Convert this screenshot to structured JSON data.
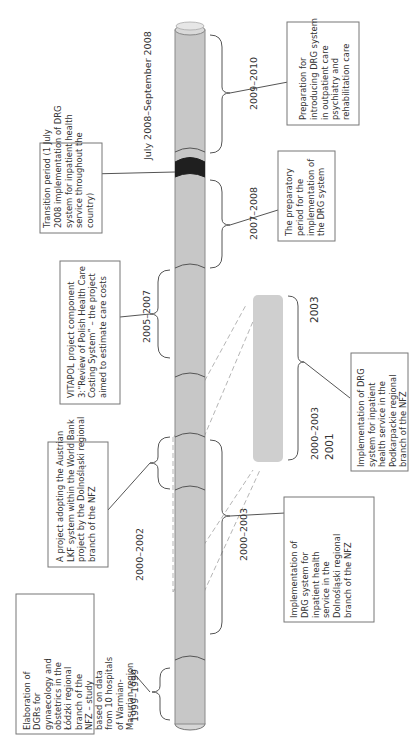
{
  "diagram": {
    "orientation": "rotated-90-ccw",
    "colors": {
      "tube": "#c7c7c7",
      "tube_edge": "#888888",
      "transition_band": "#1f1f1f",
      "inset_bar": "#cfcfcf",
      "dashed_guide": "#b5b5b5",
      "box_border": "#777777",
      "text": "#333333"
    },
    "periods": [
      {
        "id": "p1999",
        "label": "1999–1999",
        "description": [
          "Elaboration of",
          "DGRs for",
          "gynaecology and",
          "obstetrics in the",
          "Łódzki regional",
          "branch of the",
          "NFZ – study",
          "based on data",
          "from 10 hospitals",
          "of Warmian-",
          "Masurian region"
        ]
      },
      {
        "id": "p2000_2002",
        "label": "2000–2002",
        "description": [
          "A project adopting the Austrian",
          "LKF system within the World Bank",
          "project by the Dolnośląski regional",
          "branch of the NFZ"
        ]
      },
      {
        "id": "p2000_2003_dolnoslaski",
        "label": "2000–2003",
        "description": [
          "Implementation of",
          "DRG system for",
          "inpatient health",
          "service in the",
          "Dolnośląski regional",
          "branch of the NFZ"
        ]
      },
      {
        "id": "p2005_2007",
        "label": "2005–2007",
        "description": [
          "VITAPOL project component",
          "3:“Review of Polish Health Care",
          "Costing System” – the project",
          "aimed to estimate care costs"
        ]
      },
      {
        "id": "p2007_2008",
        "label": "2007–2008",
        "description": [
          "The preparatory",
          "period for the",
          "implementation of",
          "the DRG system"
        ]
      },
      {
        "id": "p_transition",
        "label": "July 2008–September 2008",
        "description": [
          "Transition period (1 July",
          "2008 implementation of DRG",
          "system for inpatient health",
          "service throughout the",
          "country)"
        ]
      },
      {
        "id": "p2009_2010",
        "label": "2009–2010",
        "description": [
          "Preparation for",
          "introducing DRG system",
          "in outpatient care",
          "psychiatry and",
          "rehabilitation care"
        ]
      }
    ],
    "inset": {
      "id": "podkarpackie",
      "label": "2000–2003",
      "start_year": "2001",
      "end_year": "2003",
      "description": [
        "Implementation of DRG",
        "system for inpatient",
        "health service in the",
        "Podkarpackie regional",
        "branch of the NFZ"
      ]
    }
  }
}
